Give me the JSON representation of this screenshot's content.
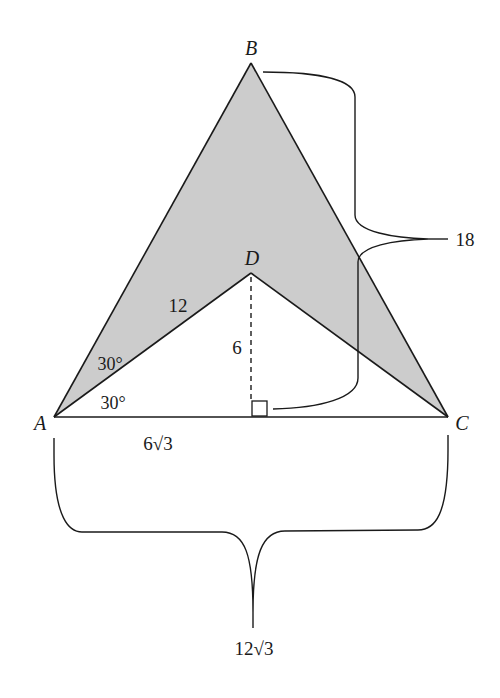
{
  "figure": {
    "fill_color": "#cccccc",
    "stroke_color": "#1a1a1a",
    "background": "#ffffff"
  },
  "points": {
    "A": {
      "label": "A",
      "x": 54,
      "y": 417
    },
    "B": {
      "label": "B",
      "x": 251,
      "y": 63
    },
    "C": {
      "label": "C",
      "x": 448,
      "y": 417
    },
    "D": {
      "label": "D",
      "x": 251,
      "y": 273
    }
  },
  "labels": {
    "side_AD": "12",
    "height_D": "6",
    "angle_BAD": "30°",
    "angle_DAC": "30°",
    "half_base": "6√3",
    "full_base": "12√3",
    "height_B": "18"
  },
  "shapes": {
    "shaded_region": "ABCD (concave quadrilateral)",
    "dashed_altitude": "D to foot on AC",
    "right_angle_marker": "at foot of altitude"
  }
}
